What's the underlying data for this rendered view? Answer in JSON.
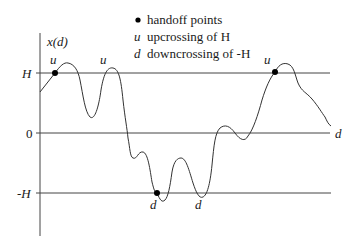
{
  "diagram": {
    "y_axis_label": "x(d)",
    "x_axis_label": "d",
    "levels": [
      {
        "label": "H",
        "y": 73
      },
      {
        "label": "0",
        "y": 133
      },
      {
        "label": "-H",
        "y": 193
      }
    ],
    "legend": [
      {
        "symbol": "●",
        "text": "handoff points"
      },
      {
        "symbol": "u",
        "text": "upcrossing of H"
      },
      {
        "symbol": "d",
        "text": "downcrossing of -H"
      }
    ],
    "markers": [
      {
        "label": "u",
        "type": "upcrossing",
        "handoff": true
      },
      {
        "label": "u",
        "type": "upcrossing",
        "handoff": false
      },
      {
        "label": "d",
        "type": "downcrossing",
        "handoff": true
      },
      {
        "label": "d",
        "type": "downcrossing",
        "handoff": false
      },
      {
        "label": "u",
        "type": "upcrossing",
        "handoff": true
      }
    ],
    "colors": {
      "line": "#444444",
      "text": "#1a1a1a",
      "dot": "#000000"
    }
  }
}
